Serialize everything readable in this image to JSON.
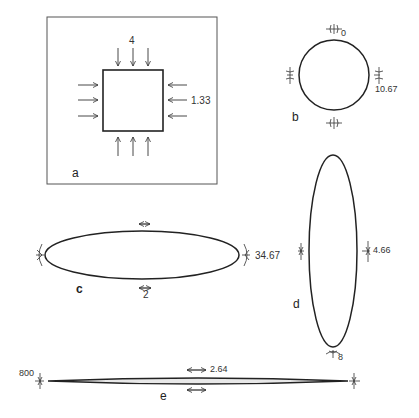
{
  "panels": {
    "a": {
      "letter": "a",
      "shape": "square",
      "top_value": "4",
      "side_value": "1.33"
    },
    "b": {
      "letter": "b",
      "shape": "circle",
      "top_value": "0",
      "side_value": "10.67"
    },
    "c": {
      "letter": "c",
      "shape": "horizontal-ellipse",
      "side_value": "34.67",
      "bottom_value": "2"
    },
    "d": {
      "letter": "d",
      "shape": "vertical-ellipse",
      "side_value": "4.66",
      "bottom_value": "8"
    },
    "e": {
      "letter": "e",
      "shape": "slit",
      "left_value": "800",
      "top_value": "2.64"
    }
  },
  "colors": {
    "ink": "#222222",
    "frame": "#555555",
    "background": "#ffffff"
  }
}
